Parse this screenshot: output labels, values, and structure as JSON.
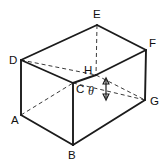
{
  "figure": {
    "kind": "geometry-diagram",
    "shape": "rectangular-prism",
    "background_color": "#ffffff",
    "line_color": "#1b1b1b",
    "dashed_line_color": "#3a3a3a",
    "labels": {
      "a": "A",
      "b": "B",
      "c": "C",
      "d": "D",
      "e": "E",
      "f": "F",
      "g": "G",
      "h": "H",
      "theta": "θ"
    },
    "label_positions": {
      "a": {
        "x": 11,
        "y": 124
      },
      "b": {
        "x": 68,
        "y": 159
      },
      "c": {
        "x": 76,
        "y": 93
      },
      "d": {
        "x": 9,
        "y": 64
      },
      "e": {
        "x": 93,
        "y": 18
      },
      "f": {
        "x": 149,
        "y": 47
      },
      "g": {
        "x": 150,
        "y": 105
      },
      "h": {
        "x": 85,
        "y": 74
      },
      "theta": {
        "x": 89,
        "y": 93
      }
    },
    "vertices": {
      "a": {
        "x": 21,
        "y": 115
      },
      "b": {
        "x": 73,
        "y": 145
      },
      "c": {
        "x": 73,
        "y": 83
      },
      "d": {
        "x": 21,
        "y": 60
      },
      "e": {
        "x": 97,
        "y": 25
      },
      "f": {
        "x": 146,
        "y": 50
      },
      "g": {
        "x": 145,
        "y": 100
      },
      "h": {
        "x": 96,
        "y": 75
      }
    },
    "solid_edges": [
      {
        "name": "edge-d-e",
        "from": "d",
        "to": "e"
      },
      {
        "name": "edge-e-f",
        "from": "e",
        "to": "f"
      },
      {
        "name": "edge-d-c",
        "from": "d",
        "to": "c"
      },
      {
        "name": "edge-c-h",
        "from": "c",
        "to": "h"
      },
      {
        "name": "edge-h-f",
        "from": "h",
        "to": "f"
      },
      {
        "name": "edge-f-g",
        "from": "f",
        "to": "g"
      },
      {
        "name": "edge-d-a",
        "from": "d",
        "to": "a"
      },
      {
        "name": "edge-a-b",
        "from": "a",
        "to": "b"
      },
      {
        "name": "edge-b-g",
        "from": "b",
        "to": "g"
      },
      {
        "name": "edge-c-b",
        "from": "c",
        "to": "b"
      }
    ],
    "dashed_edges": [
      {
        "name": "edge-e-h",
        "from": "e",
        "to": "h"
      },
      {
        "name": "edge-d-h",
        "from": "d",
        "to": "h"
      },
      {
        "name": "edge-h-g",
        "from": "h",
        "to": "g"
      },
      {
        "name": "edge-a-c",
        "from": "a",
        "to": "c"
      },
      {
        "name": "edge-c-g",
        "from": "c",
        "to": "g"
      }
    ],
    "angle_marker": {
      "name": "theta-angle",
      "symbol": "θ",
      "arrow": {
        "x": 106,
        "y_top": 79,
        "y_bottom": 99
      }
    }
  }
}
